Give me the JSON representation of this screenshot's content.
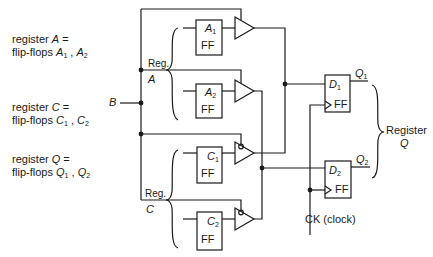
{
  "left_notes": [
    {
      "line1_prefix": "register ",
      "line1_var": "A",
      "line1_suffix": " =",
      "line2_prefix": "flip-flops ",
      "v1": "A",
      "s1": "1",
      "sep": " , ",
      "v2": "A",
      "s2": "2"
    },
    {
      "line1_prefix": "register ",
      "line1_var": "C",
      "line1_suffix": " =",
      "line2_prefix": "flip-flops ",
      "v1": "C",
      "s1": "1",
      "sep": " , ",
      "v2": "C",
      "s2": "2"
    },
    {
      "line1_prefix": "register ",
      "line1_var": "Q",
      "line1_suffix": " =",
      "line2_prefix": "flip-flops ",
      "v1": "Q",
      "s1": "1",
      "sep": " , ",
      "v2": "Q",
      "s2": "2"
    }
  ],
  "bus_input": {
    "label": "B"
  },
  "reg_a": {
    "reg_label": "Reg.",
    "name": "A"
  },
  "reg_c": {
    "reg_label": "Reg.",
    "name": "C"
  },
  "flipflops": [
    {
      "id": "A1",
      "var": "A",
      "sub": "1",
      "type": "FF"
    },
    {
      "id": "A2",
      "var": "A",
      "sub": "2",
      "type": "FF"
    },
    {
      "id": "C1",
      "var": "C",
      "sub": "1",
      "type": "FF"
    },
    {
      "id": "C2",
      "var": "C",
      "sub": "2",
      "type": "FF"
    },
    {
      "id": "D1",
      "var": "D",
      "sub": "1",
      "type": "FF"
    },
    {
      "id": "D2",
      "var": "D",
      "sub": "2",
      "type": "FF"
    }
  ],
  "outputs": [
    {
      "var": "Q",
      "sub": "1"
    },
    {
      "var": "Q",
      "sub": "2"
    }
  ],
  "register_q": {
    "line1": "Register",
    "line2": "Q"
  },
  "clock": {
    "label": "CK (clock)"
  },
  "colors": {
    "line": "#1a1a1a",
    "background": "#ffffff"
  }
}
